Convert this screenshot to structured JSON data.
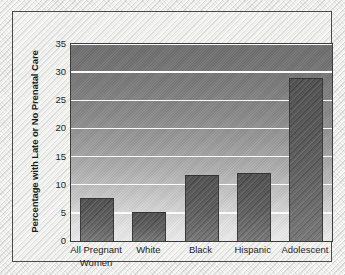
{
  "chart_data": {
    "type": "bar",
    "title": "",
    "subtitle": "",
    "xlabel": "",
    "ylabel": "Percentage with Late or No Prenatal Care",
    "ylim": [
      0,
      35
    ],
    "yticks": [
      0,
      5,
      10,
      15,
      20,
      25,
      30,
      35
    ],
    "ytick_labels": [
      "0",
      "5",
      "10",
      "15",
      "20",
      "25",
      "30",
      "35"
    ],
    "grid": true,
    "grid_axis": "y",
    "legend": false,
    "legend_position": "none",
    "categories": [
      "All Pregnant\nWomen",
      "White",
      "Black",
      "Hispanic",
      "Adolescent"
    ],
    "category_lines": [
      [
        "All Pregnant",
        "Women"
      ],
      [
        "White"
      ],
      [
        "Black"
      ],
      [
        "Hispanic"
      ],
      [
        "Adolescent"
      ]
    ],
    "values": [
      7.7,
      5.1,
      11.7,
      12.0,
      29.0
    ],
    "annotations": [],
    "colors": {
      "bar_fill_top": "#4e4e4e",
      "bar_fill_bottom": "#767676",
      "bar_edge": "#3a3a3a",
      "plot_bg_top": "#6f6f6f",
      "plot_bg_bottom": "#ebebeb",
      "gridline": "#fbfbfb",
      "axis": "#3c3c3c",
      "frame_border": "#4b4b4b",
      "page_bg": "#eeeeec",
      "text": "#1d1d1d"
    }
  }
}
